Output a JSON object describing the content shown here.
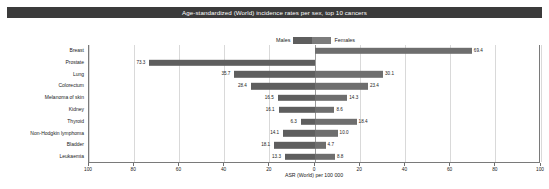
{
  "chart_data": {
    "type": "bar",
    "subtype": "back-to-back-horizontal",
    "title": "Age-standardized (World) incidence rates per sex, top 10 cancers",
    "xlabel": "ASR (World) per 100 000",
    "ylabel": "",
    "xlim": [
      -100,
      100
    ],
    "xticks": [
      100,
      80,
      60,
      40,
      20,
      0,
      20,
      40,
      60,
      80,
      100
    ],
    "grid": true,
    "legend_position": "top-center",
    "categories": [
      "Breast",
      "Prostate",
      "Lung",
      "Colorectum",
      "Melanoma of skin",
      "Kidney",
      "Thyroid",
      "Non-Hodgkin lymphoma",
      "Bladder",
      "Leukaemia"
    ],
    "series": [
      {
        "name": "Males",
        "color": "#5e5e5e",
        "direction": "left",
        "values": [
          null,
          73.3,
          35.7,
          28.4,
          16.5,
          16.1,
          6.3,
          14.1,
          18.1,
          13.3
        ],
        "labels": [
          "",
          "73.3",
          "35.7",
          "28.4",
          "16.5",
          "16.1",
          "6.3",
          "14.1",
          "18.1",
          "13.3"
        ]
      },
      {
        "name": "Females",
        "color": "#6e6e6e",
        "direction": "right",
        "values": [
          69.4,
          null,
          30.1,
          23.4,
          14.3,
          8.6,
          18.4,
          10.0,
          4.7,
          8.8
        ],
        "labels": [
          "69.4",
          "",
          "30.1",
          "23.4",
          "14.3",
          "8.6",
          "18.4",
          "10.0",
          "4.7",
          "8.8"
        ]
      }
    ]
  },
  "legend": {
    "males_label": "Males",
    "females_label": "Females",
    "males_color": "#5e5e5e",
    "females_color": "#6e6e6e"
  }
}
